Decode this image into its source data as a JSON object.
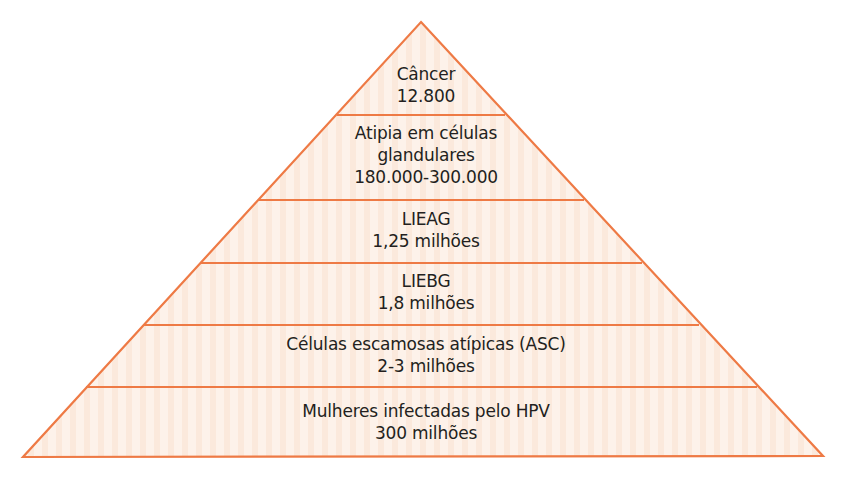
{
  "diagram": {
    "type": "pyramid",
    "colors": {
      "stroke": "#ee7a45",
      "fill": "#fdf1e8",
      "stripe": "#fbe6d6",
      "text": "#231f20"
    },
    "levels": [
      {
        "label": "Câncer",
        "value": "12.800"
      },
      {
        "label": "Atipia em células",
        "label2": "glandulares",
        "value": "180.000-300.000"
      },
      {
        "label": "LIEAG",
        "value": "1,25 milhões"
      },
      {
        "label": "LIEBG",
        "value": "1,8 milhões"
      },
      {
        "label": "Células escamosas atípicas (ASC)",
        "value": "2-3 milhões"
      },
      {
        "label": "Mulheres infectadas pelo HPV",
        "value": "300 milhões"
      }
    ]
  }
}
